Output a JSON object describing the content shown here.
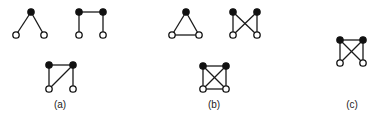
{
  "figure": {
    "groups": [
      {
        "label": "(a)",
        "graphs": [
          {
            "id": "a1",
            "nodes": [
              {
                "id": "n1",
                "color": "black"
              },
              {
                "id": "n2",
                "color": "white"
              },
              {
                "id": "n3",
                "color": "white"
              }
            ],
            "edges": [
              [
                "n1",
                "n2"
              ],
              [
                "n1",
                "n3"
              ]
            ]
          },
          {
            "id": "a2",
            "nodes": [
              {
                "id": "n1",
                "color": "black"
              },
              {
                "id": "n2",
                "color": "black"
              },
              {
                "id": "n3",
                "color": "white"
              },
              {
                "id": "n4",
                "color": "white"
              }
            ],
            "edges": [
              [
                "n1",
                "n2"
              ],
              [
                "n1",
                "n3"
              ],
              [
                "n2",
                "n4"
              ]
            ]
          },
          {
            "id": "a3",
            "nodes": [
              {
                "id": "n1",
                "color": "black"
              },
              {
                "id": "n2",
                "color": "black"
              },
              {
                "id": "n3",
                "color": "white"
              },
              {
                "id": "n4",
                "color": "white"
              }
            ],
            "edges": [
              [
                "n1",
                "n2"
              ],
              [
                "n1",
                "n3"
              ],
              [
                "n2",
                "n4"
              ],
              [
                "n2",
                "n3"
              ]
            ]
          }
        ]
      },
      {
        "label": "(b)",
        "graphs": [
          {
            "id": "b1",
            "nodes": [
              {
                "id": "n1",
                "color": "black"
              },
              {
                "id": "n2",
                "color": "white"
              },
              {
                "id": "n3",
                "color": "white"
              }
            ],
            "edges": [
              [
                "n1",
                "n2"
              ],
              [
                "n1",
                "n3"
              ],
              [
                "n2",
                "n3"
              ]
            ]
          },
          {
            "id": "b2",
            "nodes": [
              {
                "id": "n1",
                "color": "black"
              },
              {
                "id": "n2",
                "color": "black"
              },
              {
                "id": "n3",
                "color": "white"
              },
              {
                "id": "n4",
                "color": "white"
              }
            ],
            "edges": [
              [
                "n1",
                "n3"
              ],
              [
                "n2",
                "n4"
              ],
              [
                "n1",
                "n4"
              ],
              [
                "n2",
                "n3"
              ]
            ]
          },
          {
            "id": "b3",
            "nodes": [
              {
                "id": "n1",
                "color": "black"
              },
              {
                "id": "n2",
                "color": "black"
              },
              {
                "id": "n3",
                "color": "white"
              },
              {
                "id": "n4",
                "color": "white"
              }
            ],
            "edges": [
              [
                "n1",
                "n2"
              ],
              [
                "n1",
                "n3"
              ],
              [
                "n2",
                "n4"
              ],
              [
                "n3",
                "n4"
              ],
              [
                "n1",
                "n4"
              ],
              [
                "n2",
                "n3"
              ]
            ]
          }
        ]
      },
      {
        "label": "(c)",
        "graphs": [
          {
            "id": "c1",
            "nodes": [
              {
                "id": "n1",
                "color": "black"
              },
              {
                "id": "n2",
                "color": "black"
              },
              {
                "id": "n3",
                "color": "white"
              },
              {
                "id": "n4",
                "color": "white"
              }
            ],
            "edges": [
              [
                "n1",
                "n2"
              ],
              [
                "n1",
                "n3"
              ],
              [
                "n2",
                "n4"
              ],
              [
                "n1",
                "n4"
              ],
              [
                "n2",
                "n3"
              ]
            ]
          }
        ]
      }
    ],
    "colors": {
      "black_node": "#111111",
      "white_node": "#ffffff",
      "edge": "#1a1a1a"
    }
  }
}
